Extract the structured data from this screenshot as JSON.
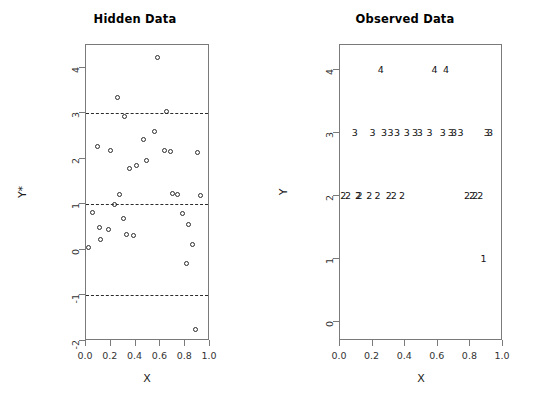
{
  "figure": {
    "width": 540,
    "height": 405,
    "background": "#ffffff",
    "foreground": "#1a1a1a"
  },
  "chart_data": [
    {
      "type": "scatter",
      "panel": "left",
      "title": "Hidden Data",
      "xlabel": "X",
      "ylabel": "Y*",
      "xlim": [
        0.0,
        1.0
      ],
      "ylim": [
        -2,
        4.5
      ],
      "xticks": [
        0.0,
        0.2,
        0.4,
        0.6,
        0.8,
        1.0
      ],
      "xticklabels": [
        "0.0",
        "0.2",
        "0.4",
        "0.6",
        "0.8",
        "1.0"
      ],
      "yticks": [
        -2,
        -1,
        0,
        1,
        2,
        3,
        4
      ],
      "yticklabels": [
        "-2",
        "-1",
        "0",
        "1",
        "2",
        "3",
        "4"
      ],
      "grid": false,
      "legend": null,
      "marker": "open-circle",
      "thresholds": [
        -1,
        1,
        3
      ],
      "threshold_style": "dashed",
      "x": [
        0.02,
        0.05,
        0.09,
        0.11,
        0.12,
        0.18,
        0.2,
        0.23,
        0.25,
        0.27,
        0.3,
        0.31,
        0.33,
        0.35,
        0.38,
        0.41,
        0.46,
        0.49,
        0.55,
        0.58,
        0.63,
        0.65,
        0.68,
        0.7,
        0.74,
        0.78,
        0.81,
        0.83,
        0.86,
        0.88,
        0.9,
        0.92
      ],
      "y": [
        0.05,
        0.82,
        2.28,
        0.5,
        0.22,
        0.45,
        2.18,
        1.0,
        3.35,
        1.22,
        0.68,
        2.92,
        0.33,
        1.78,
        0.32,
        1.85,
        2.42,
        1.96,
        2.6,
        4.22,
        2.18,
        3.05,
        2.16,
        1.25,
        1.22,
        0.8,
        -0.3,
        0.55,
        0.12,
        -1.75,
        2.15,
        1.2
      ]
    },
    {
      "type": "scatter",
      "panel": "right",
      "title": "Observed Data",
      "xlabel": "X",
      "ylabel": "Y",
      "xlim": [
        0.0,
        1.0
      ],
      "ylim": [
        -0.3,
        4.4
      ],
      "xticks": [
        0.0,
        0.2,
        0.4,
        0.6,
        0.8,
        1.0
      ],
      "xticklabels": [
        "0.0",
        "0.2",
        "0.4",
        "0.6",
        "0.8",
        "1.0"
      ],
      "yticks": [
        0,
        1,
        2,
        3,
        4
      ],
      "yticklabels": [
        "0",
        "1",
        "2",
        "3",
        "4"
      ],
      "grid": false,
      "legend": null,
      "marker": "digit-label",
      "x": [
        0.02,
        0.05,
        0.09,
        0.11,
        0.12,
        0.18,
        0.2,
        0.23,
        0.25,
        0.27,
        0.3,
        0.31,
        0.33,
        0.35,
        0.38,
        0.41,
        0.46,
        0.49,
        0.55,
        0.58,
        0.63,
        0.65,
        0.68,
        0.7,
        0.74,
        0.78,
        0.81,
        0.83,
        0.86,
        0.88,
        0.9,
        0.92
      ],
      "y": [
        2,
        2,
        3,
        2,
        2,
        2,
        3,
        2,
        4,
        3,
        2,
        3,
        2,
        3,
        2,
        3,
        3,
        3,
        3,
        4,
        3,
        4,
        3,
        3,
        3,
        2,
        2,
        2,
        2,
        1,
        3,
        3
      ],
      "labels": [
        "2",
        "2",
        "3",
        "2",
        "2",
        "2",
        "3",
        "2",
        "4",
        "3",
        "2",
        "3",
        "2",
        "3",
        "2",
        "3",
        "3",
        "3",
        "3",
        "4",
        "3",
        "4",
        "3",
        "3",
        "3",
        "2",
        "2",
        "2",
        "2",
        "1",
        "3",
        "3"
      ]
    }
  ],
  "left_panel": {
    "title": "Hidden Data",
    "xlabel": "X",
    "ylabel": "Y*"
  },
  "right_panel": {
    "title": "Observed Data",
    "xlabel": "X",
    "ylabel": "Y"
  }
}
